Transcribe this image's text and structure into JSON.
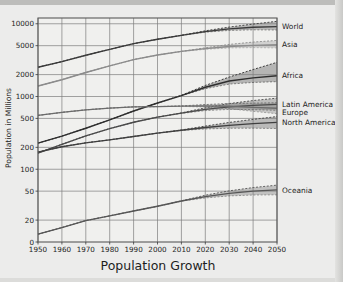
{
  "chart_data": {
    "type": "line",
    "title": "Population Growth",
    "xlabel": "Population Growth",
    "ylabel": "Population in Millions",
    "yscale": "log",
    "ylim": [
      10,
      12000
    ],
    "xlim": [
      1950,
      2050
    ],
    "grid": true,
    "legend_position": "right-inline",
    "xticks": [
      1950,
      1960,
      1970,
      1980,
      1990,
      2000,
      2010,
      2020,
      2030,
      2040,
      2050
    ],
    "yticks": [
      0,
      20,
      50,
      100,
      200,
      500,
      1000,
      2000,
      5000,
      10000
    ],
    "ytick_labels": [
      "0",
      "20",
      "50",
      "100",
      "200",
      "500",
      "1000",
      "2000",
      "5000",
      "10000"
    ],
    "x": [
      1950,
      1960,
      1970,
      1980,
      1990,
      2000,
      2010,
      2020,
      2030,
      2040,
      2050
    ],
    "projection_start": 2010,
    "series": [
      {
        "name": "World",
        "label": "World",
        "color": "#3a3a3a",
        "values": [
          2525,
          3018,
          3691,
          4449,
          5320,
          6127,
          6930,
          7795,
          8500,
          8950,
          9150
        ],
        "upper": [
          2525,
          3018,
          3691,
          4449,
          5320,
          6127,
          6960,
          8000,
          9000,
          9900,
          10800
        ],
        "lower": [
          2525,
          3018,
          3691,
          4449,
          5320,
          6127,
          6900,
          7650,
          8100,
          8250,
          8200
        ]
      },
      {
        "name": "Asia",
        "label": "Asia",
        "color": "#8c8c8c",
        "values": [
          1395,
          1700,
          2138,
          2632,
          3221,
          3719,
          4165,
          4545,
          4870,
          5050,
          5150
        ],
        "upper": [
          1395,
          1700,
          2138,
          2632,
          3221,
          3719,
          4180,
          4680,
          5200,
          5600,
          5900
        ],
        "lower": [
          1395,
          1700,
          2138,
          2632,
          3221,
          3719,
          4150,
          4450,
          4650,
          4700,
          4650
        ]
      },
      {
        "name": "Africa",
        "label": "Africa",
        "color": "#2e2e2e",
        "values": [
          229,
          285,
          366,
          478,
          632,
          814,
          1031,
          1341,
          1634,
          1800,
          1930
        ],
        "upper": [
          229,
          285,
          366,
          478,
          632,
          814,
          1040,
          1420,
          1850,
          2350,
          2950
        ],
        "lower": [
          229,
          285,
          366,
          478,
          632,
          814,
          1025,
          1280,
          1480,
          1560,
          1600
        ]
      },
      {
        "name": "Latin America",
        "label": "Latin America",
        "color": "#4a4a4a",
        "values": [
          167,
          220,
          287,
          362,
          443,
          521,
          590,
          665,
          721,
          757,
          780
        ],
        "upper": [
          167,
          220,
          287,
          362,
          443,
          521,
          596,
          700,
          800,
          880,
          950
        ],
        "lower": [
          167,
          220,
          287,
          362,
          443,
          521,
          585,
          640,
          665,
          660,
          645
        ]
      },
      {
        "name": "Europe",
        "label": "Europe",
        "color": "#6b6b6b",
        "values": [
          549,
          605,
          656,
          693,
          721,
          727,
          738,
          743,
          735,
          710,
          690
        ],
        "upper": [
          549,
          605,
          656,
          693,
          721,
          727,
          742,
          775,
          800,
          810,
          820
        ],
        "lower": [
          549,
          605,
          656,
          693,
          721,
          727,
          733,
          715,
          680,
          625,
          580
        ]
      },
      {
        "name": "North America",
        "label": "North America",
        "color": "#3f3f3f",
        "values": [
          172,
          204,
          231,
          254,
          282,
          314,
          344,
          375,
          401,
          423,
          440
        ],
        "upper": [
          172,
          204,
          231,
          254,
          282,
          314,
          347,
          392,
          440,
          485,
          530
        ],
        "lower": [
          172,
          204,
          231,
          254,
          282,
          314,
          341,
          358,
          366,
          367,
          363
        ]
      },
      {
        "name": "Oceania",
        "label": "Oceania",
        "color": "#565656",
        "values": [
          12.8,
          15.8,
          19.7,
          22.9,
          26.7,
          31.0,
          36.6,
          42.1,
          46.7,
          50.0,
          52.0
        ],
        "upper": [
          12.8,
          15.8,
          19.7,
          22.9,
          26.7,
          31.0,
          36.8,
          44.0,
          50.5,
          56.0,
          60.5
        ],
        "lower": [
          12.8,
          15.8,
          19.7,
          22.9,
          26.7,
          31.0,
          36.4,
          40.3,
          43.0,
          44.2,
          44.5
        ]
      }
    ]
  }
}
